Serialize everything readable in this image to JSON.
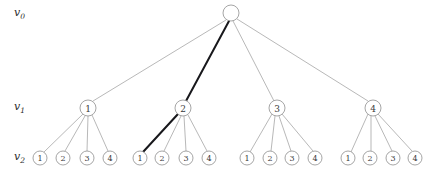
{
  "figure": {
    "type": "tree-diagram",
    "background_color": "#ffffff",
    "edge_color": "#9a9a9a",
    "highlight_color": "#18181c",
    "node_stroke_color": "#8e8e8e",
    "node_fill_color": "#ffffff",
    "text_color": "#3a3a3a"
  },
  "row_labels": [
    {
      "id": "v0",
      "base": "v",
      "sub": "0",
      "x": 14,
      "y": 16
    },
    {
      "id": "v1",
      "base": "v",
      "sub": "1",
      "x": 14,
      "y": 110
    },
    {
      "id": "v2",
      "base": "v",
      "sub": "2",
      "x": 14,
      "y": 160
    }
  ],
  "levels": {
    "v0_y": 13,
    "v1_y": 108,
    "v2_y": 158
  },
  "root": {
    "id": "root",
    "label": "",
    "x": 231,
    "y": 13,
    "r": 8,
    "highlighted": false
  },
  "level1_nodes": [
    {
      "id": "n1",
      "label": "1",
      "x": 88,
      "y": 108,
      "r": 8,
      "highlighted": false
    },
    {
      "id": "n2",
      "label": "2",
      "x": 183,
      "y": 108,
      "r": 8,
      "highlighted": true
    },
    {
      "id": "n3",
      "label": "3",
      "x": 277,
      "y": 108,
      "r": 8,
      "highlighted": false
    },
    {
      "id": "n4",
      "label": "4",
      "x": 373,
      "y": 108,
      "r": 8,
      "highlighted": false
    }
  ],
  "level2_nodes": [
    {
      "id": "g1l1",
      "label": "1",
      "x": 40,
      "y": 158,
      "r": 7,
      "parent": "n1",
      "highlighted": false
    },
    {
      "id": "g1l2",
      "label": "2",
      "x": 63,
      "y": 158,
      "r": 7,
      "parent": "n1",
      "highlighted": false
    },
    {
      "id": "g1l3",
      "label": "3",
      "x": 87,
      "y": 158,
      "r": 7,
      "parent": "n1",
      "highlighted": false
    },
    {
      "id": "g1l4",
      "label": "4",
      "x": 110,
      "y": 158,
      "r": 7,
      "parent": "n1",
      "highlighted": false
    },
    {
      "id": "g2l1",
      "label": "1",
      "x": 140,
      "y": 158,
      "r": 7,
      "parent": "n2",
      "highlighted": true
    },
    {
      "id": "g2l2",
      "label": "2",
      "x": 162,
      "y": 158,
      "r": 7,
      "parent": "n2",
      "highlighted": false
    },
    {
      "id": "g2l3",
      "label": "3",
      "x": 186,
      "y": 158,
      "r": 7,
      "parent": "n2",
      "highlighted": false
    },
    {
      "id": "g2l4",
      "label": "4",
      "x": 209,
      "y": 158,
      "r": 7,
      "parent": "n2",
      "highlighted": false
    },
    {
      "id": "g3l1",
      "label": "1",
      "x": 247,
      "y": 158,
      "r": 7,
      "parent": "n3",
      "highlighted": false
    },
    {
      "id": "g3l2",
      "label": "2",
      "x": 270,
      "y": 158,
      "r": 7,
      "parent": "n3",
      "highlighted": false
    },
    {
      "id": "g3l3",
      "label": "3",
      "x": 292,
      "y": 158,
      "r": 7,
      "parent": "n3",
      "highlighted": false
    },
    {
      "id": "g3l4",
      "label": "4",
      "x": 315,
      "y": 158,
      "r": 7,
      "parent": "n3",
      "highlighted": false
    },
    {
      "id": "g4l1",
      "label": "1",
      "x": 348,
      "y": 158,
      "r": 7,
      "parent": "n4",
      "highlighted": false
    },
    {
      "id": "g4l2",
      "label": "2",
      "x": 370,
      "y": 158,
      "r": 7,
      "parent": "n4",
      "highlighted": false
    },
    {
      "id": "g4l3",
      "label": "3",
      "x": 393,
      "y": 158,
      "r": 7,
      "parent": "n4",
      "highlighted": false
    },
    {
      "id": "g4l4",
      "label": "4",
      "x": 415,
      "y": 158,
      "r": 7,
      "parent": "n4",
      "highlighted": false
    }
  ],
  "edges_level0_to_1": [
    {
      "id": "e-root-n1",
      "from": "root",
      "to": "n1",
      "x1": 226,
      "y1": 20,
      "x2": 93,
      "y2": 101,
      "highlighted": false
    },
    {
      "id": "e-root-n2",
      "from": "root",
      "to": "n2",
      "x1": 229,
      "y1": 21,
      "x2": 186,
      "y2": 101,
      "highlighted": true
    },
    {
      "id": "e-root-n3",
      "from": "root",
      "to": "n3",
      "x1": 233,
      "y1": 21,
      "x2": 274,
      "y2": 101,
      "highlighted": false
    },
    {
      "id": "e-root-n4",
      "from": "root",
      "to": "n4",
      "x1": 237,
      "y1": 19,
      "x2": 368,
      "y2": 101,
      "highlighted": false
    }
  ],
  "edges_level1_to_2": [
    {
      "id": "e-n1-g1l1",
      "from": "n1",
      "to": "g1l1",
      "x1": 83,
      "y1": 114,
      "x2": 44,
      "y2": 152,
      "highlighted": false
    },
    {
      "id": "e-n1-g1l2",
      "from": "n1",
      "to": "g1l2",
      "x1": 85,
      "y1": 116,
      "x2": 65,
      "y2": 151,
      "highlighted": false
    },
    {
      "id": "e-n1-g1l3",
      "from": "n1",
      "to": "g1l3",
      "x1": 88,
      "y1": 116,
      "x2": 87,
      "y2": 151,
      "highlighted": false
    },
    {
      "id": "e-n1-g1l4",
      "from": "n1",
      "to": "g1l4",
      "x1": 92,
      "y1": 115,
      "x2": 108,
      "y2": 151,
      "highlighted": false
    },
    {
      "id": "e-n2-g2l1",
      "from": "n2",
      "to": "g2l1",
      "x1": 178,
      "y1": 114,
      "x2": 143,
      "y2": 152,
      "highlighted": true
    },
    {
      "id": "e-n2-g2l2",
      "from": "n2",
      "to": "g2l2",
      "x1": 181,
      "y1": 116,
      "x2": 164,
      "y2": 151,
      "highlighted": false
    },
    {
      "id": "e-n2-g2l3",
      "from": "n2",
      "to": "g2l3",
      "x1": 184,
      "y1": 116,
      "x2": 186,
      "y2": 151,
      "highlighted": false
    },
    {
      "id": "e-n2-g2l4",
      "from": "n2",
      "to": "g2l4",
      "x1": 188,
      "y1": 115,
      "x2": 207,
      "y2": 151,
      "highlighted": false
    },
    {
      "id": "e-n3-g3l1",
      "from": "n3",
      "to": "g3l1",
      "x1": 272,
      "y1": 114,
      "x2": 250,
      "y2": 152,
      "highlighted": false
    },
    {
      "id": "e-n3-g3l2",
      "from": "n3",
      "to": "g3l2",
      "x1": 275,
      "y1": 116,
      "x2": 271,
      "y2": 151,
      "highlighted": false
    },
    {
      "id": "e-n3-g3l3",
      "from": "n3",
      "to": "g3l3",
      "x1": 279,
      "y1": 116,
      "x2": 291,
      "y2": 151,
      "highlighted": false
    },
    {
      "id": "e-n3-g3l4",
      "from": "n3",
      "to": "g3l4",
      "x1": 282,
      "y1": 114,
      "x2": 313,
      "y2": 151,
      "highlighted": false
    },
    {
      "id": "e-n4-g4l1",
      "from": "n4",
      "to": "g4l1",
      "x1": 368,
      "y1": 114,
      "x2": 351,
      "y2": 152,
      "highlighted": false
    },
    {
      "id": "e-n4-g4l2",
      "from": "n4",
      "to": "g4l2",
      "x1": 371,
      "y1": 116,
      "x2": 371,
      "y2": 151,
      "highlighted": false
    },
    {
      "id": "e-n4-g4l3",
      "from": "n4",
      "to": "g4l3",
      "x1": 375,
      "y1": 116,
      "x2": 392,
      "y2": 151,
      "highlighted": false
    },
    {
      "id": "e-n4-g4l4",
      "from": "n4",
      "to": "g4l4",
      "x1": 378,
      "y1": 114,
      "x2": 412,
      "y2": 151,
      "highlighted": false
    }
  ]
}
